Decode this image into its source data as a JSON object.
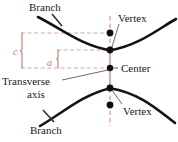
{
  "figure": {
    "kind": "hyperbola-parts-diagram",
    "title": "",
    "colors": {
      "curve": "#141414",
      "leader": "#5a5a5a",
      "axis_dashed": "#d9907f",
      "brace": "#c2796b",
      "dot": "#101010",
      "guide_dashed": "#d9a79a",
      "background": "#ffffff",
      "text": "#1a1a1a"
    },
    "labels": {
      "branch_top": "Branch",
      "vertex_top": "Vertex",
      "center": "Center",
      "transverse": "Transverse",
      "axis": "axis",
      "vertex_bottom": "Vertex",
      "branch_bottom": "Branch",
      "c": "c",
      "a": "a"
    },
    "points": [
      {
        "name": "focus-upper",
        "x": 110,
        "y": 33
      },
      {
        "name": "vertex-upper",
        "x": 110,
        "y": 50
      },
      {
        "name": "center",
        "x": 110,
        "y": 68
      },
      {
        "name": "vertex-lower",
        "x": 110,
        "y": 88
      },
      {
        "name": "focus-lower",
        "x": 110,
        "y": 105
      }
    ],
    "measures": {
      "c_from_y": 33,
      "c_to_y": 68,
      "a_from_y": 50,
      "a_to_y": 68
    }
  }
}
